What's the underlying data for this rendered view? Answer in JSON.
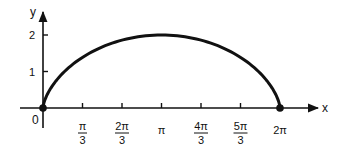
{
  "chart_data": {
    "type": "line",
    "title": "",
    "xlabel": "x",
    "ylabel": "y",
    "origin_label": "0",
    "xlim": [
      0,
      6.2832
    ],
    "ylim": [
      0,
      2
    ],
    "grid": false,
    "legend": null,
    "curve": "cycloid: x = t - sin t, y = 1 - cos t, t in [0, 2π]",
    "x_ticks": [
      {
        "value": 1.0472,
        "num": "π",
        "den": "3"
      },
      {
        "value": 2.0944,
        "num": "2π",
        "den": "3"
      },
      {
        "value": 3.1416,
        "num": "π",
        "den": ""
      },
      {
        "value": 4.1888,
        "num": "4π",
        "den": "3"
      },
      {
        "value": 5.236,
        "num": "5π",
        "den": "3"
      },
      {
        "value": 6.2832,
        "num": "2π",
        "den": ""
      }
    ],
    "y_ticks": [
      {
        "value": 1,
        "label": "1"
      },
      {
        "value": 2,
        "label": "2"
      }
    ],
    "series": [
      {
        "name": "cycloid",
        "x": [
          0,
          0.0783,
          0.2827,
          0.5708,
          0.9069,
          1.2589,
          1.6047,
          1.9267,
          2.2122,
          2.4528,
          2.6427,
          2.7781,
          2.8568,
          2.8784,
          3.1416,
          3.4048,
          3.4264,
          3.5051,
          3.6405,
          3.8304,
          4.071,
          4.3565,
          4.6785,
          5.0243,
          5.3763,
          5.7124,
          6.0005,
          6.2049,
          6.2832
        ],
        "y": [
          0,
          0.293,
          0.5468,
          0.8,
          1.0,
          1.2,
          1.4,
          1.6,
          1.75,
          1.85,
          1.93,
          1.97,
          1.99,
          2.0,
          2.0,
          2.0,
          1.99,
          1.97,
          1.93,
          1.85,
          1.75,
          1.6,
          1.4,
          1.2,
          1.0,
          0.8,
          0.5468,
          0.293,
          0
        ]
      }
    ],
    "endpoints": [
      {
        "x": 0,
        "y": 0
      },
      {
        "x": 6.2832,
        "y": 0
      }
    ],
    "colors": {
      "line": "#111111",
      "axis": "#111111"
    }
  }
}
